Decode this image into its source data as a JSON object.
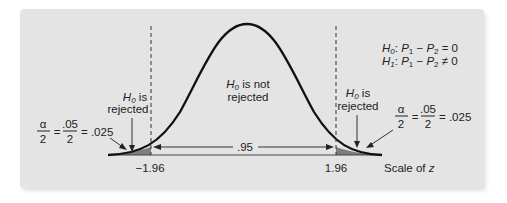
{
  "diagram": {
    "type": "two-tailed normal distribution (z test)",
    "hypotheses": {
      "h0": "H0: P1 − P2 = 0",
      "h1": "H1: P1 − P2 ≠ 0"
    },
    "regions": {
      "left_reject": {
        "line1": "H0 is",
        "line2": "rejected"
      },
      "center_accept": {
        "line1": "H0 is not",
        "line2": "rejected"
      },
      "right_reject": {
        "line1": "H0 is",
        "line2": "rejected"
      }
    },
    "tail_area": {
      "alpha_num": "α",
      "alpha_den": "2",
      "eq1": "=",
      "frac_num": ".05",
      "frac_den": "2",
      "eq2": "= .025"
    },
    "center_area_label": ".95",
    "critical_values": {
      "left": "−1.96",
      "right": "1.96"
    },
    "axis_label": "Scale of z",
    "colors": {
      "background": "#e4e4e4",
      "curve": "#111111",
      "shaded_tail": "#7d7d7d",
      "dashed_line": "#333333"
    }
  }
}
